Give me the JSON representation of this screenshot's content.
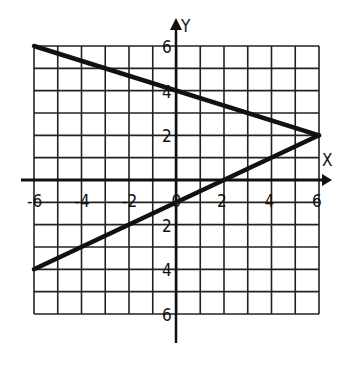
{
  "chart_data": {
    "type": "line",
    "title": "",
    "xlabel": "X",
    "ylabel": "Y",
    "xlim": [
      -6,
      6
    ],
    "ylim": [
      -6,
      6
    ],
    "grid": true,
    "grid_step": 1,
    "x_tick_labels": [
      "-6",
      "-4",
      "-2",
      "0",
      "2",
      "4",
      "6"
    ],
    "y_tick_labels": [
      "6",
      "4",
      "2",
      "2",
      "4",
      "6"
    ],
    "series": [
      {
        "name": "line-1",
        "points": [
          [
            -6,
            6
          ],
          [
            6,
            2
          ]
        ],
        "slope": -0.3333,
        "y_intercept": 4
      },
      {
        "name": "line-2",
        "points": [
          [
            -6,
            -4
          ],
          [
            6,
            2
          ]
        ],
        "slope": 0.5,
        "y_intercept": -1,
        "x_intercept": 2
      }
    ],
    "intersection": [
      6,
      2
    ]
  },
  "axes": {
    "x_label": "X",
    "y_label": "Y"
  },
  "ticks": {
    "x": [
      {
        "v": -6,
        "t": "-6"
      },
      {
        "v": -4,
        "t": "-4"
      },
      {
        "v": -2,
        "t": "-2"
      },
      {
        "v": 0,
        "t": "0"
      },
      {
        "v": 2,
        "t": "2"
      },
      {
        "v": 4,
        "t": "4"
      },
      {
        "v": 6,
        "t": "6"
      }
    ],
    "y": [
      {
        "v": 6,
        "t": "6"
      },
      {
        "v": 4,
        "t": "4"
      },
      {
        "v": 2,
        "t": "2"
      },
      {
        "v": -2,
        "t": "2"
      },
      {
        "v": -4,
        "t": "4"
      },
      {
        "v": -6,
        "t": "6"
      }
    ]
  },
  "colors": {
    "ink": "#111111",
    "background": "#ffffff"
  }
}
